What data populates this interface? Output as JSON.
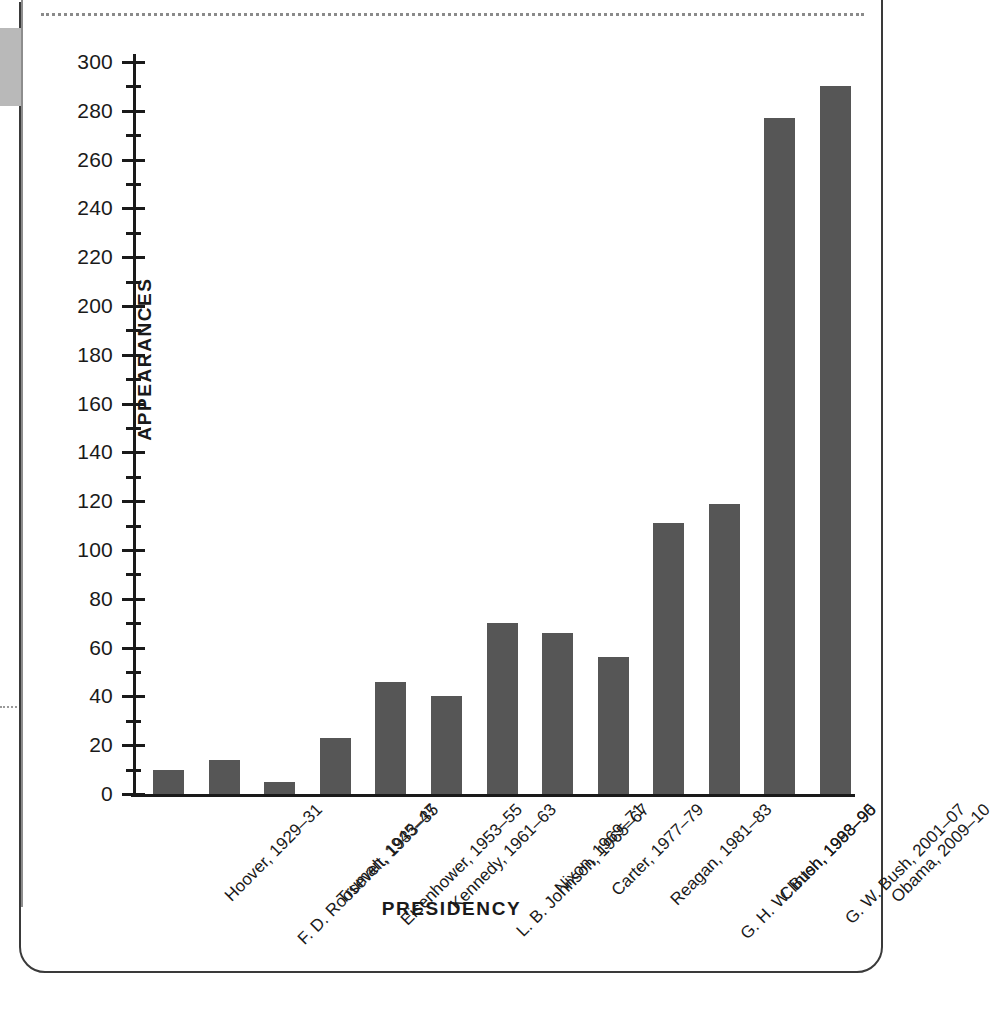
{
  "figure": {
    "y_axis_title": "APPEARANCES",
    "x_axis_title": "PRESIDENCY"
  },
  "chart_data": {
    "type": "bar",
    "title": "",
    "xlabel": "PRESIDENCY",
    "ylabel": "APPEARANCES",
    "ylim": [
      0,
      300
    ],
    "ytick_step": 20,
    "yminor_step": 10,
    "grid": false,
    "legend": "none",
    "bar_color": "#565656",
    "categories": [
      "Hoover, 1929–31",
      "F. D. Roosevelt, 1933–35",
      "Truman, 1945–47",
      "Eisenhower, 1953–55",
      "Kennedy, 1961–63",
      "L. B. Johnson, 1965–67",
      "Nixon, 1969–71",
      "Carter, 1977–79",
      "Reagan, 1981–83",
      "G. H. W. Bush, 1988–90",
      "Clinton, 1993–95",
      "G. W. Bush, 2001–07",
      "Obama, 2009–10"
    ],
    "values": [
      10,
      14,
      5,
      23,
      46,
      40,
      70,
      66,
      56,
      111,
      119,
      277,
      290
    ],
    "ytick_labels": [
      "0",
      "20",
      "40",
      "60",
      "80",
      "100",
      "120",
      "140",
      "160",
      "180",
      "200",
      "220",
      "240",
      "260",
      "280",
      "300"
    ],
    "ytick_values": [
      0,
      20,
      40,
      60,
      80,
      100,
      120,
      140,
      160,
      180,
      200,
      220,
      240,
      260,
      280,
      300
    ],
    "yminor_values": [
      10,
      30,
      50,
      70,
      90,
      110,
      130,
      150,
      170,
      190,
      210,
      230,
      250,
      270,
      290
    ]
  }
}
